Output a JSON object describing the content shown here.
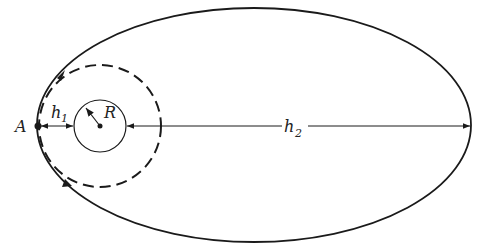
{
  "diagram": {
    "labels": {
      "point_a": "A",
      "radius": "R",
      "h1_main": "h",
      "h1_sub": "1",
      "h2_main": "h",
      "h2_sub": "2"
    },
    "elements": {
      "ellipse": {
        "cx": 254,
        "cy": 125,
        "rx": 217,
        "ry": 117,
        "style": "solid"
      },
      "planet_circle": {
        "cx": 100,
        "cy": 126,
        "r": 26,
        "style": "solid"
      },
      "circular_orbit": {
        "cx": 100,
        "cy": 126,
        "r": 61,
        "style": "dashed"
      }
    },
    "colors": {
      "stroke": "#1a1a1a",
      "background": "#ffffff"
    }
  }
}
